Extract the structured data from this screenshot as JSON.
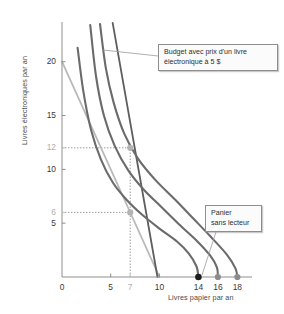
{
  "chart_data": {
    "type": "line",
    "title": "",
    "xlabel": "Livres papier par an",
    "ylabel": "Livres électroniques par an",
    "xlim": [
      0,
      19.5
    ],
    "ylim": [
      0,
      23.5
    ],
    "grid": false,
    "legend": "none",
    "xticks": [
      {
        "value": 0,
        "label": "0",
        "muted": false
      },
      {
        "value": 5,
        "label": "5",
        "muted": false
      },
      {
        "value": 7,
        "label": "7",
        "muted": true
      },
      {
        "value": 10,
        "label": "10",
        "muted": false
      },
      {
        "value": 14,
        "label": "14",
        "muted": false
      },
      {
        "value": 16,
        "label": "16",
        "muted": false
      },
      {
        "value": 18,
        "label": "18",
        "muted": false
      }
    ],
    "yticks": [
      {
        "value": 20,
        "label": "20",
        "muted": false
      },
      {
        "value": 15,
        "label": "15",
        "muted": false
      },
      {
        "value": 12,
        "label": "12",
        "muted": true
      },
      {
        "value": 10,
        "label": "10",
        "muted": false
      },
      {
        "value": 6,
        "label": "6",
        "muted": true
      },
      {
        "value": 5,
        "label": "5",
        "muted": false
      }
    ],
    "series": [
      {
        "name": "budget-line-original",
        "kind": "budget",
        "color": "#b9b9b9",
        "points": [
          [
            0,
            20
          ],
          [
            10,
            0
          ]
        ]
      },
      {
        "name": "budget-line-ebook-5-dollars",
        "kind": "budget",
        "color": "#5e5e5e",
        "points": [
          [
            5.2,
            23.6
          ],
          [
            9.8,
            0
          ]
        ]
      },
      {
        "name": "indifference-curve-1",
        "kind": "indifference",
        "color": "#6b6b6b",
        "points": [
          [
            1.6,
            21.3
          ],
          [
            2.2,
            17.2
          ],
          [
            3.0,
            13.6
          ],
          [
            4.0,
            10.9
          ],
          [
            5.2,
            8.8
          ],
          [
            6.6,
            7.2
          ],
          [
            8.2,
            5.8
          ],
          [
            10.0,
            4.5
          ],
          [
            11.8,
            3.3
          ],
          [
            13.0,
            2.2
          ],
          [
            13.8,
            1.0
          ],
          [
            14.0,
            0
          ]
        ]
      },
      {
        "name": "indifference-curve-2",
        "kind": "indifference",
        "color": "#6b6b6b",
        "points": [
          [
            2.9,
            23.4
          ],
          [
            3.5,
            18.6
          ],
          [
            4.3,
            15.0
          ],
          [
            5.4,
            12.2
          ],
          [
            6.8,
            9.9
          ],
          [
            8.4,
            8.1
          ],
          [
            10.2,
            6.5
          ],
          [
            12.0,
            4.9
          ],
          [
            13.8,
            3.4
          ],
          [
            15.2,
            2.0
          ],
          [
            15.9,
            0.9
          ],
          [
            16.0,
            0
          ]
        ]
      },
      {
        "name": "indifference-curve-3",
        "kind": "indifference",
        "color": "#6b6b6b",
        "points": [
          [
            3.9,
            23.5
          ],
          [
            4.5,
            19.4
          ],
          [
            5.3,
            16.2
          ],
          [
            6.4,
            13.3
          ],
          [
            7.8,
            11.0
          ],
          [
            9.6,
            9.0
          ],
          [
            11.6,
            7.2
          ],
          [
            13.4,
            5.5
          ],
          [
            15.2,
            3.8
          ],
          [
            16.9,
            2.1
          ],
          [
            17.8,
            0.8
          ],
          [
            18.0,
            0
          ]
        ]
      }
    ],
    "markers": [
      {
        "name": "choice-with-reader-high",
        "x": 7,
        "y": 12,
        "color": "#b3b3b3",
        "radius": 3.1
      },
      {
        "name": "choice-with-reader-low",
        "x": 7,
        "y": 6,
        "color": "#b3b3b3",
        "radius": 3.1
      },
      {
        "name": "basket-no-reader",
        "x": 14,
        "y": 0,
        "color": "#1d1d1d",
        "radius": 3.3
      },
      {
        "name": "basket-16",
        "x": 16,
        "y": 0,
        "color": "#8c8c8c",
        "radius": 3.1
      },
      {
        "name": "basket-18",
        "x": 18,
        "y": 0,
        "color": "#8c8c8c",
        "radius": 3.1
      }
    ],
    "guidelines": [
      {
        "name": "vertical-guide-7",
        "orientation": "vertical",
        "value": 7,
        "from": 0,
        "to": 12.4
      },
      {
        "name": "horizontal-guide-12",
        "orientation": "horizontal",
        "value": 12,
        "from": 0,
        "to": 7
      },
      {
        "name": "horizontal-guide-6",
        "orientation": "horizontal",
        "value": 6,
        "from": 0,
        "to": 7
      }
    ],
    "annotations": [
      {
        "name": "budget-callout",
        "lines": [
          "Budget avec prix d'un livre",
          "électronique à 5 $"
        ],
        "leader_from": [
          158,
          56
        ],
        "leader_to": [
          103,
          50
        ]
      },
      {
        "name": "basket-callout",
        "lines": [
          "Panier",
          "sans lecteur"
        ],
        "leader_from": [
          216,
          232
        ],
        "leader_to": [
          202,
          275
        ]
      }
    ]
  }
}
